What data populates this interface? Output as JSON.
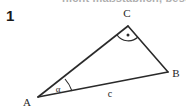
{
  "figure": {
    "problem_number": "1",
    "clipped_heading": "nicht maßstäblich, beschriftet",
    "background_color": "#ffffff",
    "stroke_color": "#2a2a2a"
  },
  "diagram": {
    "type": "triangle",
    "caption_number": "1",
    "vertices": [
      {
        "name": "A",
        "label": "A",
        "x": 38,
        "y": 97,
        "label_x": 27,
        "label_y": 103
      },
      {
        "name": "B",
        "label": "B",
        "x": 168,
        "y": 72,
        "label_x": 174,
        "label_y": 78
      },
      {
        "name": "C",
        "label": "C",
        "x": 128,
        "y": 26,
        "label_x": 125,
        "label_y": 17
      }
    ],
    "sides": [
      {
        "name": "side-ab",
        "label": "c",
        "from": "A",
        "to": "B",
        "label_x": 110,
        "label_y": 96
      },
      {
        "name": "side-bc",
        "label": "",
        "from": "B",
        "to": "C"
      },
      {
        "name": "side-ca",
        "label": "",
        "from": "C",
        "to": "A"
      }
    ],
    "angles": [
      {
        "name": "angle-a",
        "label": "α",
        "at": "A",
        "marker": "arc",
        "label_x": 55,
        "label_y": 93
      },
      {
        "name": "angle-c",
        "label": "",
        "at": "C",
        "marker": "right-angle-arc-dot"
      }
    ]
  }
}
